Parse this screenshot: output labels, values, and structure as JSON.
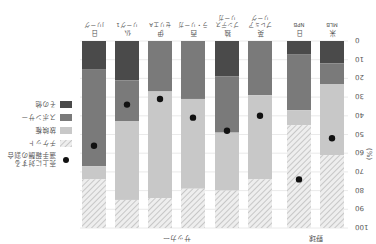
{
  "chart_data": {
    "type": "bar",
    "stacked": true,
    "orientation_note": "image rendered rotated 180 degrees",
    "title": "",
    "ylabel": "(%)",
    "ylim": [
      0,
      100
    ],
    "yticks": [
      0,
      10,
      20,
      30,
      40,
      50,
      60,
      70,
      80,
      90,
      100
    ],
    "grid": true,
    "groups": [
      {
        "label": "野球",
        "categories": [
          0,
          1
        ]
      },
      {
        "label": "サッカー",
        "categories": [
          2,
          3,
          4,
          5,
          6,
          7
        ]
      }
    ],
    "categories": [
      {
        "line1": "米",
        "line2": "MLB"
      },
      {
        "line1": "日",
        "line2": "NPB"
      },
      {
        "line1": "英",
        "line2": "プレミア",
        "line3": "リーグ"
      },
      {
        "line1": "独",
        "line2": "ブンデス",
        "line3": "リーガ"
      },
      {
        "line1": "西",
        "line2": "ラ・リーガ"
      },
      {
        "line1": "伊",
        "line2": "セリエA"
      },
      {
        "line1": "仏",
        "line2": "リーグ1"
      },
      {
        "line1": "日",
        "line2": "Jリーグ"
      }
    ],
    "series": [
      {
        "name": "その他",
        "color": "#4a4a4a",
        "values": [
          12,
          7,
          0,
          19,
          0,
          0,
          21,
          15
        ]
      },
      {
        "name": "スポンサー",
        "color": "#7a7a7a",
        "values": [
          11,
          30,
          29,
          30,
          31,
          27,
          22,
          52
        ]
      },
      {
        "name": "放映権",
        "color": "#c8c8c8",
        "values": [
          38,
          8,
          45,
          31,
          48,
          57,
          42,
          7
        ]
      },
      {
        "name": "チケット",
        "color": "#e6e6e6",
        "pattern": "hatch",
        "values": [
          39,
          55,
          26,
          20,
          21,
          16,
          15,
          26
        ]
      }
    ],
    "markers": {
      "name": "売上に対する\n選手報酬の割合",
      "color": "#111111",
      "values": [
        52,
        74,
        40,
        48,
        41,
        31,
        34,
        56
      ]
    },
    "legend": {
      "position": "right",
      "items": [
        "売上に対する選手報酬の割合",
        "チケット",
        "放映権",
        "スポンサー",
        "その他"
      ]
    }
  }
}
